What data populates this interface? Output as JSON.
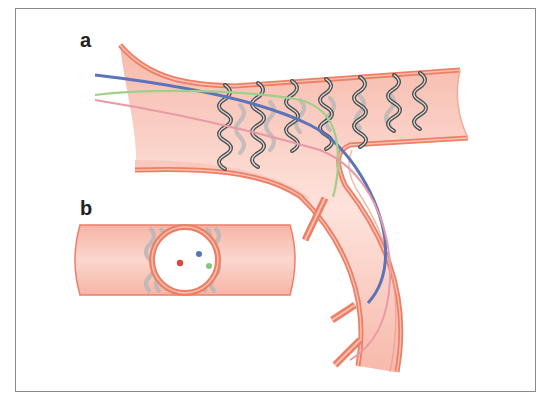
{
  "figure": {
    "panels": [
      {
        "id": "a",
        "label": "a",
        "description": "Stent deployed across bifurcation with three guidewires"
      },
      {
        "id": "b",
        "label": "b",
        "description": "Cross-section view through stent showing wire positions"
      }
    ],
    "colors": {
      "vessel_fill": "#f9c9bf",
      "vessel_wall": "#ec7f66",
      "vessel_wall_light": "#f6a996",
      "stent_dark": "#4e4e4e",
      "stent_light": "#b5b5b5",
      "wire_blue": "#5b74b8",
      "wire_green": "#9fcf8c",
      "wire_pink": "#e99aa6",
      "dot_red": "#e0473b",
      "dot_blue": "#5873c0",
      "dot_green": "#84c77b",
      "frame": "#8a8a8a"
    },
    "wires": [
      {
        "name": "blue-guidewire",
        "color": "#5b74b8"
      },
      {
        "name": "green-guidewire",
        "color": "#9fcf8c"
      },
      {
        "name": "pink-guidewire",
        "color": "#e99aa6"
      }
    ]
  }
}
